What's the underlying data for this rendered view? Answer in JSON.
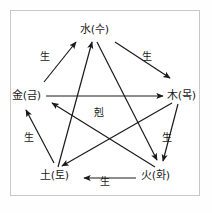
{
  "diagram": {
    "frame_color": "#c9c9c9",
    "line_color": "#1a1a1a",
    "background": "#ffffff",
    "center_label": "剋",
    "nodes": [
      {
        "id": "water",
        "label": "水(수)",
        "position": "top"
      },
      {
        "id": "wood",
        "label": "木(목)",
        "position": "right"
      },
      {
        "id": "fire",
        "label": "火(화)",
        "position": "bottom-right"
      },
      {
        "id": "earth",
        "label": "土(토)",
        "position": "bottom-left"
      },
      {
        "id": "metal",
        "label": "金(금)",
        "position": "left"
      }
    ],
    "generating_cycle": {
      "name": "生",
      "edges": [
        {
          "id": "metal-water",
          "label": "生",
          "from": "metal",
          "to": "water"
        },
        {
          "id": "water-wood",
          "label": "生",
          "from": "water",
          "to": "wood"
        },
        {
          "id": "wood-fire",
          "label": "生",
          "from": "wood",
          "to": "fire"
        },
        {
          "id": "fire-earth",
          "label": "生",
          "from": "fire",
          "to": "earth"
        },
        {
          "id": "earth-metal",
          "label": "生",
          "from": "earth",
          "to": "metal"
        }
      ]
    },
    "overcoming_cycle": {
      "name": "剋",
      "edges": [
        {
          "id": "water-fire",
          "from": "water",
          "to": "fire"
        },
        {
          "id": "fire-metal",
          "from": "fire",
          "to": "metal"
        },
        {
          "id": "metal-wood",
          "from": "metal",
          "to": "wood"
        },
        {
          "id": "wood-earth",
          "from": "wood",
          "to": "earth"
        },
        {
          "id": "earth-water",
          "from": "earth",
          "to": "water"
        }
      ]
    }
  }
}
